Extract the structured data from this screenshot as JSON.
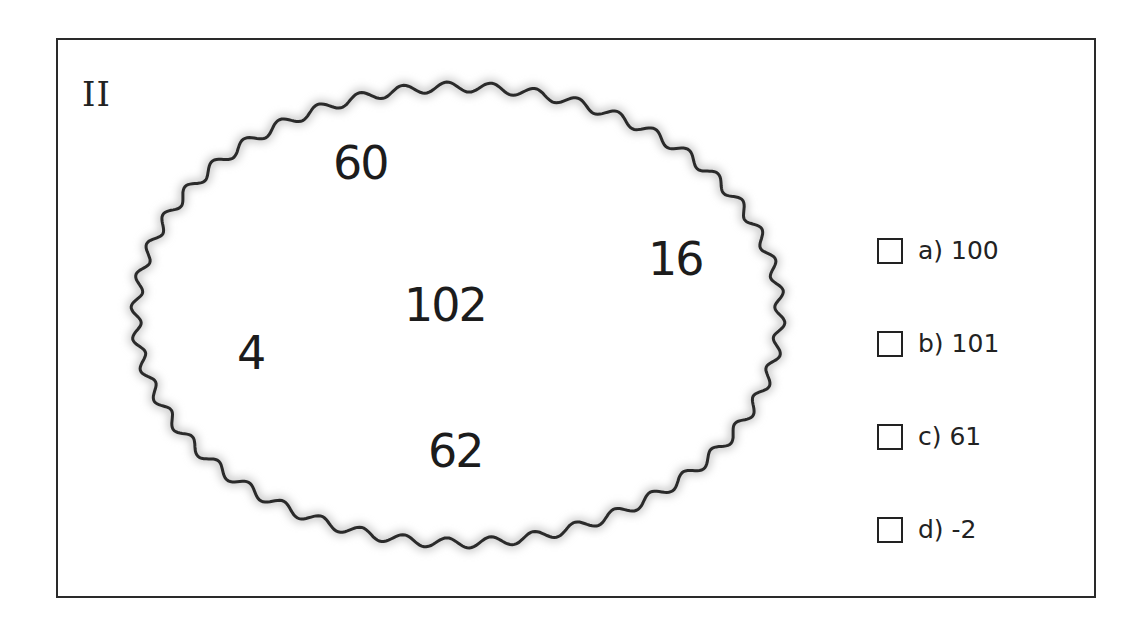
{
  "figure": {
    "label": "II",
    "region_values": [
      {
        "value": "60",
        "x": 333,
        "y": 136
      },
      {
        "value": "16",
        "x": 648,
        "y": 232
      },
      {
        "value": "102",
        "x": 404,
        "y": 278
      },
      {
        "value": "4",
        "x": 237,
        "y": 326
      },
      {
        "value": "62",
        "x": 428,
        "y": 424
      }
    ],
    "shape": {
      "type": "wavy-ellipse",
      "cx": 458,
      "cy": 315,
      "rx": 322,
      "ry": 228,
      "stroke": "#2a2a2a"
    }
  },
  "options": [
    {
      "letter": "a)",
      "text": "100"
    },
    {
      "letter": "b)",
      "text": "101"
    },
    {
      "letter": "c)",
      "text": "61"
    },
    {
      "letter": "d)",
      "text": "-2"
    }
  ]
}
